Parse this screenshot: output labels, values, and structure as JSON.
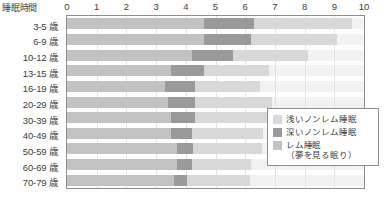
{
  "axis": {
    "title": "睡眠時間",
    "xticks": [
      "0",
      "1",
      "2",
      "3",
      "4",
      "5",
      "6",
      "7",
      "8",
      "9",
      "10"
    ]
  },
  "legend": {
    "items": [
      {
        "label": "浅いノンレム睡眠",
        "sub": "",
        "color": "#d8d8d8"
      },
      {
        "label": "深いノンレム睡眠",
        "sub": "",
        "color": "#9a9a9a"
      },
      {
        "label": "レム睡眠",
        "sub": "（夢を見る眠り）",
        "color": "#c2c2c2"
      }
    ]
  },
  "caption": {
    "text": ""
  },
  "colors": {
    "light_non_rem": "#d8d8d8",
    "deep_non_rem": "#9a9a9a",
    "rem": "#c2c2c2",
    "band": "#f2f2f2",
    "grid": "#e3e3e3",
    "axis": "#8d8d8d"
  },
  "chart_data": {
    "type": "bar",
    "orientation": "horizontal",
    "stacked": true,
    "title": "",
    "xlabel": "睡眠時間",
    "ylabel": "",
    "xlim": [
      0,
      10
    ],
    "grid": true,
    "legend_position": "bottom-right-inside",
    "xticks": [
      0,
      1,
      2,
      3,
      4,
      5,
      6,
      7,
      8,
      9,
      10
    ],
    "categories": [
      "3-5 歳",
      "6-9 歳",
      "10-12 歳",
      "13-15 歳",
      "16-19 歳",
      "20-29 歳",
      "30-39 歳",
      "40-49 歳",
      "50-59 歳",
      "60-69 歳",
      "70-79 歳"
    ],
    "series": [
      {
        "name": "レム睡眠（夢を見る眠り）",
        "color": "#c2c2c2",
        "values": [
          4.6,
          4.6,
          4.2,
          3.5,
          3.3,
          3.4,
          3.5,
          3.5,
          3.7,
          3.7,
          3.6
        ]
      },
      {
        "name": "深いノンレム睡眠",
        "color": "#9a9a9a",
        "values": [
          1.7,
          1.6,
          1.4,
          1.1,
          1.0,
          0.9,
          0.8,
          0.7,
          0.55,
          0.5,
          0.45
        ]
      },
      {
        "name": "浅いノンレム睡眠",
        "color": "#d8d8d8",
        "values": [
          3.3,
          2.9,
          2.5,
          2.2,
          2.2,
          2.6,
          2.5,
          2.4,
          2.3,
          2.0,
          2.1
        ]
      }
    ],
    "totals": [
      9.6,
      9.1,
      8.1,
      6.8,
      6.5,
      6.9,
      6.8,
      6.6,
      6.55,
      6.2,
      6.15
    ]
  }
}
